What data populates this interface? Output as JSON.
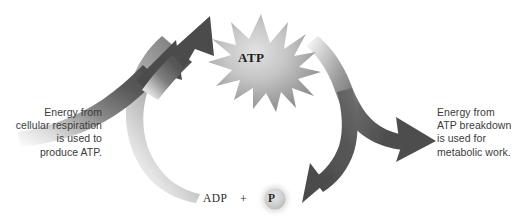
{
  "figure": {
    "background_color": "#ffffff"
  },
  "nodes": {
    "atp": {
      "label": "ATP",
      "shape": "starburst",
      "fill_color": "#9a9a9a"
    },
    "adp": {
      "label": "ADP"
    },
    "plus": {
      "label": "+"
    },
    "phosphate": {
      "label": "P",
      "shape": "circle",
      "fill_color": "#d6d6d6"
    }
  },
  "captions": {
    "left": "Energy from\ncellular respiration\nis used to\nproduce ATP.",
    "right": "Energy from\nATP breakdown\nis used for\nmetabolic work."
  },
  "arrows": {
    "left_upper": {
      "name": "energy-in-arrow-upper",
      "direction": "up-right",
      "color_dark": "#4f4f4f",
      "color_light": "#ffffff"
    },
    "left_lower": {
      "name": "energy-in-arrow-lower",
      "direction": "up-right",
      "color_dark": "#4f4f4f",
      "color_light": "#ffffff"
    },
    "left_band": {
      "name": "adp-to-atp-band",
      "direction": "up",
      "color_dark": "#8e8e8e",
      "color_light": "#ffffff"
    },
    "right_out": {
      "name": "energy-out-arrow",
      "direction": "right",
      "color_dark": "#4f4f4f",
      "color_light": "#ffffff"
    },
    "right_down": {
      "name": "atp-to-adp-arrow",
      "direction": "down-left",
      "color_dark": "#4f4f4f",
      "color_light": "#ffffff"
    }
  },
  "colors": {
    "text": "#3b3b3b",
    "molecule_text": "#2b2b2b",
    "arrow_dark": "#4f4f4f",
    "arrow_mid": "#8e8e8e",
    "star_core": "#c9c9c9",
    "star_edge": "#8a8a8a"
  }
}
